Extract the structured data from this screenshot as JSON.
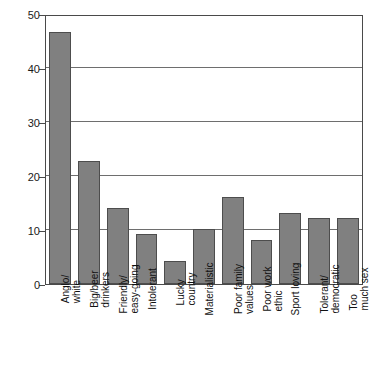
{
  "chart_data": {
    "type": "bar",
    "title": "",
    "subtitle": "",
    "xlabel": "",
    "ylabel": "",
    "ylim": [
      0,
      50
    ],
    "yticks": [
      0,
      10,
      20,
      30,
      40,
      50
    ],
    "ytick_labels": [
      "0",
      "10",
      "20",
      "30",
      "40",
      "50"
    ],
    "grid": true,
    "legend": false,
    "orientation": "vertical",
    "bar_color": "#808080",
    "bar_edge_color": "#4d4d4d",
    "categories": [
      "Anglo/ white",
      "Big/beer drinkers",
      "Friendly/ easy-going",
      "Intolerant",
      "Lucky country",
      "Materialistic",
      "Poor family values",
      "Poor work ethic",
      "Sport loving",
      "Tolerant/ democratic",
      "Too much sex"
    ],
    "category_lines": [
      [
        "Anglo/",
        "white"
      ],
      [
        "Big/beer",
        "drinkers"
      ],
      [
        "Friendly/",
        "easy-going"
      ],
      [
        "Intolerant",
        ""
      ],
      [
        "Lucky",
        "country"
      ],
      [
        "Materialistic",
        ""
      ],
      [
        "Poor family",
        "values"
      ],
      [
        "Poor work",
        "ethic"
      ],
      [
        "Sport loving",
        ""
      ],
      [
        "Tolerant/",
        "democratic"
      ],
      [
        "Too",
        "much sex"
      ]
    ],
    "values": [
      47,
      23,
      14.2,
      9.3,
      4.3,
      10.2,
      16.2,
      8.3,
      13.3,
      12.3,
      12.3
    ]
  }
}
